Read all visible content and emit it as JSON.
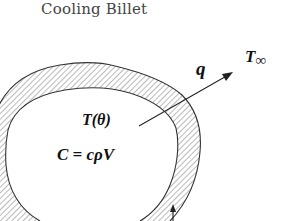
{
  "figure": {
    "title": "Cooling Billet",
    "labels": {
      "heat_flux": "q",
      "ambient_temperature": "T",
      "ambient_subscript": "∞",
      "billet_temperature": "T(θ)",
      "heat_capacity": "C = cρV"
    },
    "colors": {
      "ink": "#222222",
      "hatch": "#555555",
      "background": "#ffffff"
    }
  }
}
